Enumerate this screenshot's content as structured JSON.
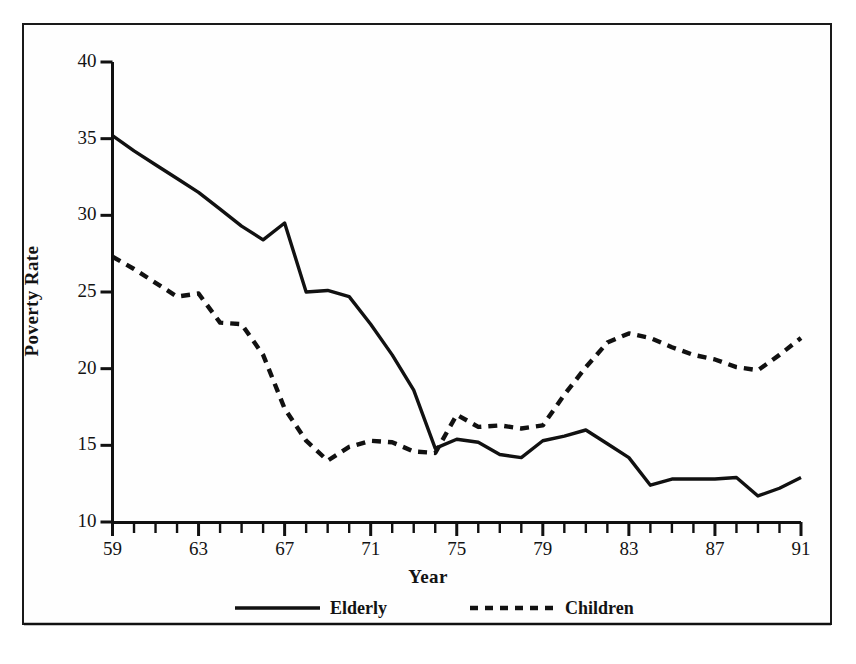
{
  "chart_data": {
    "type": "line",
    "title": "",
    "xlabel": "Year",
    "ylabel": "Poverty Rate",
    "xlim": [
      59,
      91
    ],
    "ylim": [
      10,
      40
    ],
    "ytick_values": [
      10,
      15,
      20,
      25,
      30,
      35,
      40
    ],
    "ytick_labels": [
      "10",
      "15",
      "20",
      "25",
      "30",
      "35",
      "40"
    ],
    "xtick_values": [
      59,
      63,
      67,
      71,
      75,
      79,
      83,
      87,
      91
    ],
    "xtick_labels": [
      "59",
      "63",
      "67",
      "71",
      "75",
      "79",
      "83",
      "87",
      "91"
    ],
    "minor_xticks_every": 1,
    "grid": false,
    "legend_position": "below-axes",
    "x": [
      59,
      60,
      61,
      62,
      63,
      64,
      65,
      66,
      67,
      68,
      69,
      70,
      71,
      72,
      73,
      74,
      75,
      76,
      77,
      78,
      79,
      80,
      81,
      82,
      83,
      84,
      85,
      86,
      87,
      88,
      89,
      90,
      91
    ],
    "series": [
      {
        "name": "Elderly",
        "style": "solid",
        "color": "#111111",
        "values": [
          35.2,
          34.2,
          33.3,
          32.4,
          31.5,
          30.4,
          29.3,
          28.4,
          29.5,
          25.0,
          25.1,
          24.7,
          22.9,
          20.9,
          18.6,
          14.8,
          15.4,
          15.2,
          14.4,
          14.2,
          15.3,
          15.6,
          16.0,
          15.1,
          14.2,
          12.4,
          12.8,
          12.8,
          12.8,
          12.9,
          11.7,
          12.2,
          12.9
        ]
      },
      {
        "name": "Children",
        "style": "dashed",
        "color": "#111111",
        "values": [
          27.3,
          26.5,
          25.6,
          24.7,
          24.9,
          23.0,
          22.9,
          20.9,
          17.4,
          15.3,
          14.0,
          14.9,
          15.3,
          15.2,
          14.6,
          14.5,
          17.0,
          16.2,
          16.3,
          16.1,
          16.3,
          18.3,
          20.1,
          21.7,
          22.3,
          22.0,
          21.4,
          20.9,
          20.6,
          20.1,
          19.9,
          20.9,
          22.0
        ]
      }
    ],
    "legend": [
      {
        "label": "Elderly",
        "style": "solid"
      },
      {
        "label": "Children",
        "style": "dashed"
      }
    ]
  }
}
